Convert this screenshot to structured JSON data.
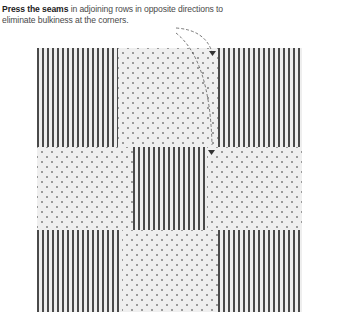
{
  "caption": {
    "bold": "Press the seams",
    "rest": " in adjoining rows in opposite directions to eliminate bulkiness at the corners."
  },
  "quilt": {
    "rows": [
      [
        "stripe",
        "dot",
        "stripe"
      ],
      [
        "dot",
        "stripe",
        "dot"
      ],
      [
        "stripe",
        "dot",
        "stripe"
      ]
    ],
    "colors": {
      "stripe_dark": "#4a4a4a",
      "stripe_light": "#eeeeee",
      "dot": "#9a9a9a",
      "fabric": "#efefef"
    }
  },
  "annotation": {
    "icon": "dashed-arrow-icon",
    "targets": [
      "top-seam",
      "middle-seam"
    ]
  }
}
